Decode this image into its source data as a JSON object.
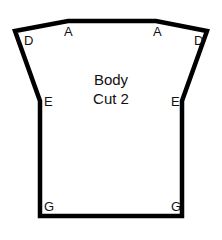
{
  "diagram": {
    "title_line1": "Body",
    "title_line2": "Cut 2",
    "stroke_color": "#000000",
    "background": "#ffffff",
    "points": {
      "left_D": "D",
      "left_A": "A",
      "right_A": "A",
      "right_D": "D",
      "left_E": "E",
      "right_E": "E",
      "left_G": "G",
      "right_G": "G"
    }
  }
}
